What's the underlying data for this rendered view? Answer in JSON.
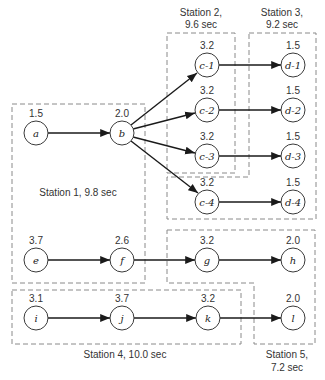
{
  "diagram": {
    "type": "precedence-diagram-line-balancing",
    "stations": [
      {
        "id": "s1",
        "label": "Station 1, 9.8 sec",
        "lines": [
          "Station 1, 9.8 sec"
        ]
      },
      {
        "id": "s2",
        "label": "Station 2, 9.6 sec",
        "lines": [
          "Station 2,",
          "9.6 sec"
        ]
      },
      {
        "id": "s3",
        "label": "Station 3, 9.2 sec",
        "lines": [
          "Station 3,",
          "9.2 sec"
        ]
      },
      {
        "id": "s4",
        "label": "Station 4, 10.0 sec",
        "lines": [
          "Station 4, 10.0 sec"
        ]
      },
      {
        "id": "s5",
        "label": "Station 5, 7.2 sec",
        "lines": [
          "Station 5,",
          "7.2 sec"
        ]
      }
    ],
    "nodes": [
      {
        "id": "a",
        "label": "a",
        "time": "1.5",
        "x": 36,
        "y": 133
      },
      {
        "id": "b",
        "label": "b",
        "time": "2.0",
        "x": 122,
        "y": 133
      },
      {
        "id": "c1",
        "label": "c-1",
        "time": "3.2",
        "x": 207,
        "y": 65
      },
      {
        "id": "c2",
        "label": "c-2",
        "time": "3.2",
        "x": 207,
        "y": 110
      },
      {
        "id": "c3",
        "label": "c-3",
        "time": "3.2",
        "x": 207,
        "y": 156
      },
      {
        "id": "c4",
        "label": "c-4",
        "time": "3.2",
        "x": 207,
        "y": 202
      },
      {
        "id": "d1",
        "label": "d-1",
        "time": "1.5",
        "x": 293,
        "y": 65
      },
      {
        "id": "d2",
        "label": "d-2",
        "time": "1.5",
        "x": 293,
        "y": 110
      },
      {
        "id": "d3",
        "label": "d-3",
        "time": "1.5",
        "x": 293,
        "y": 156
      },
      {
        "id": "d4",
        "label": "d-4",
        "time": "1.5",
        "x": 293,
        "y": 202
      },
      {
        "id": "e",
        "label": "e",
        "time": "3.7",
        "x": 36,
        "y": 260
      },
      {
        "id": "f",
        "label": "f",
        "time": "2.6",
        "x": 122,
        "y": 260
      },
      {
        "id": "g",
        "label": "g",
        "time": "3.2",
        "x": 207,
        "y": 260
      },
      {
        "id": "h",
        "label": "h",
        "time": "2.0",
        "x": 293,
        "y": 260
      },
      {
        "id": "i",
        "label": "i",
        "time": "3.1",
        "x": 36,
        "y": 318
      },
      {
        "id": "j",
        "label": "j",
        "time": "3.7",
        "x": 122,
        "y": 318
      },
      {
        "id": "k",
        "label": "k",
        "time": "3.2",
        "x": 208,
        "y": 318
      },
      {
        "id": "l",
        "label": "l",
        "time": "2.0",
        "x": 293,
        "y": 318
      }
    ],
    "edges": [
      [
        "a",
        "b"
      ],
      [
        "b",
        "c1"
      ],
      [
        "b",
        "c2"
      ],
      [
        "b",
        "c3"
      ],
      [
        "b",
        "c4"
      ],
      [
        "c1",
        "d1"
      ],
      [
        "c2",
        "d2"
      ],
      [
        "c3",
        "d3"
      ],
      [
        "c4",
        "d4"
      ],
      [
        "e",
        "f"
      ],
      [
        "f",
        "g"
      ],
      [
        "g",
        "h"
      ],
      [
        "i",
        "j"
      ],
      [
        "j",
        "k"
      ],
      [
        "k",
        "l"
      ]
    ]
  }
}
